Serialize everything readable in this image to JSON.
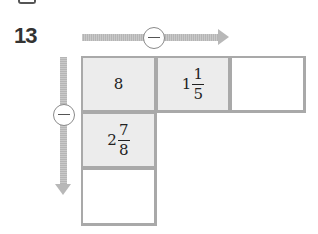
{
  "problem": {
    "number": "13",
    "horizontal_operator": "−",
    "vertical_operator": "−",
    "grid": [
      {
        "row": 1,
        "col": 1,
        "value": "8",
        "filled": true
      },
      {
        "row": 1,
        "col": 2,
        "whole": "1",
        "numerator": "1",
        "denominator": "5",
        "filled": true
      },
      {
        "row": 1,
        "col": 3,
        "value": "",
        "filled": false
      },
      {
        "row": 2,
        "col": 1,
        "whole": "2",
        "numerator": "7",
        "denominator": "8",
        "filled": true
      },
      {
        "row": 3,
        "col": 1,
        "value": "",
        "filled": false
      }
    ]
  }
}
